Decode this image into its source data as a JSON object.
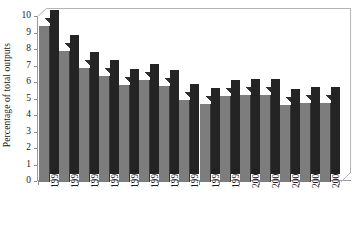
{
  "chart_data": {
    "type": "bar",
    "title": "",
    "subtitle": "",
    "xlabel": "",
    "ylabel": "Percentage of total outputs",
    "categories": [
      "1990",
      "1991",
      "1992",
      "1993",
      "1994",
      "1995",
      "1996",
      "1997",
      "1998",
      "1999",
      "2000",
      "2001",
      "2002",
      "2003",
      "2004"
    ],
    "values": [
      9.45,
      7.95,
      6.9,
      6.4,
      5.9,
      6.2,
      5.8,
      4.95,
      4.7,
      5.2,
      5.25,
      5.3,
      4.65,
      4.8,
      4.8
    ],
    "series": [
      {
        "name": "Percentage of total outputs",
        "values": [
          9.45,
          7.95,
          6.9,
          6.4,
          5.9,
          6.2,
          5.8,
          4.95,
          4.7,
          5.2,
          5.25,
          5.3,
          4.65,
          4.8,
          4.8
        ]
      }
    ],
    "ylim": [
      0,
      10
    ],
    "ytick_step": 1,
    "yticks": [
      "10",
      "9",
      "8",
      "7",
      "6",
      "5",
      "4",
      "3",
      "2",
      "1",
      "0"
    ],
    "ytick_values": [
      10,
      9,
      8,
      7,
      6,
      5,
      4,
      3,
      2,
      1,
      0
    ],
    "grid": false,
    "legend": false,
    "legend_position": "none",
    "style": "3d-column",
    "colors": {
      "bar_front": "#7d7d7d",
      "bar_side": "#242424",
      "bar_top": "#4a4a4a",
      "axis": "#9a9a9a",
      "backwall": "#b5b5b5",
      "text": "#1a1a1a",
      "background": "#ffffff"
    }
  }
}
